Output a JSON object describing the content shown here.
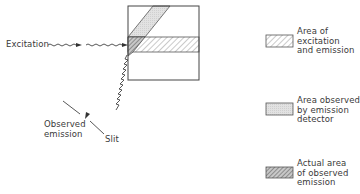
{
  "diagram": {
    "labels": {
      "excitation": "Excitation",
      "observed_emission": [
        "Observed",
        "emission"
      ],
      "slit": "Slit"
    },
    "legend": [
      {
        "pattern": "light-hatch",
        "lines": [
          "Area of",
          "excitation",
          "and emission"
        ]
      },
      {
        "pattern": "light-fill",
        "lines": [
          "Area observed",
          "by emission",
          "detector"
        ]
      },
      {
        "pattern": "dense-hatch",
        "lines": [
          "Actual area",
          "of observed",
          "emission"
        ]
      }
    ],
    "colors": {
      "line": "#444444",
      "light_fill": "#e4e4e4",
      "hatch": "#777777",
      "dense_hatch": "#555555"
    }
  }
}
